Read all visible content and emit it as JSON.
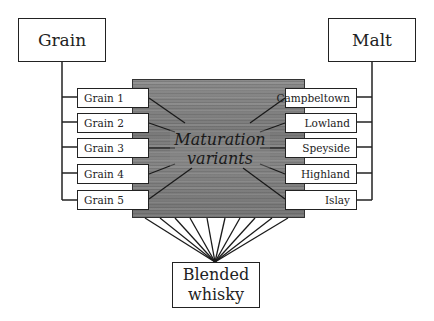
{
  "diagram": {
    "top_left": {
      "label": "Grain"
    },
    "top_right": {
      "label": "Malt"
    },
    "center": {
      "line1": "Maturation",
      "line2": "variants"
    },
    "bottom": {
      "line1": "Blended",
      "line2": "whisky"
    },
    "grain_items": [
      "Grain 1",
      "Grain 2",
      "Grain 3",
      "Grain 4",
      "Grain 5"
    ],
    "malt_items": [
      "Campbeltown",
      "Lowland",
      "Speyside",
      "Highland",
      "Islay"
    ]
  },
  "colors": {
    "line": "#222222",
    "wood": "#808080",
    "box_fill": "#ffffff"
  }
}
